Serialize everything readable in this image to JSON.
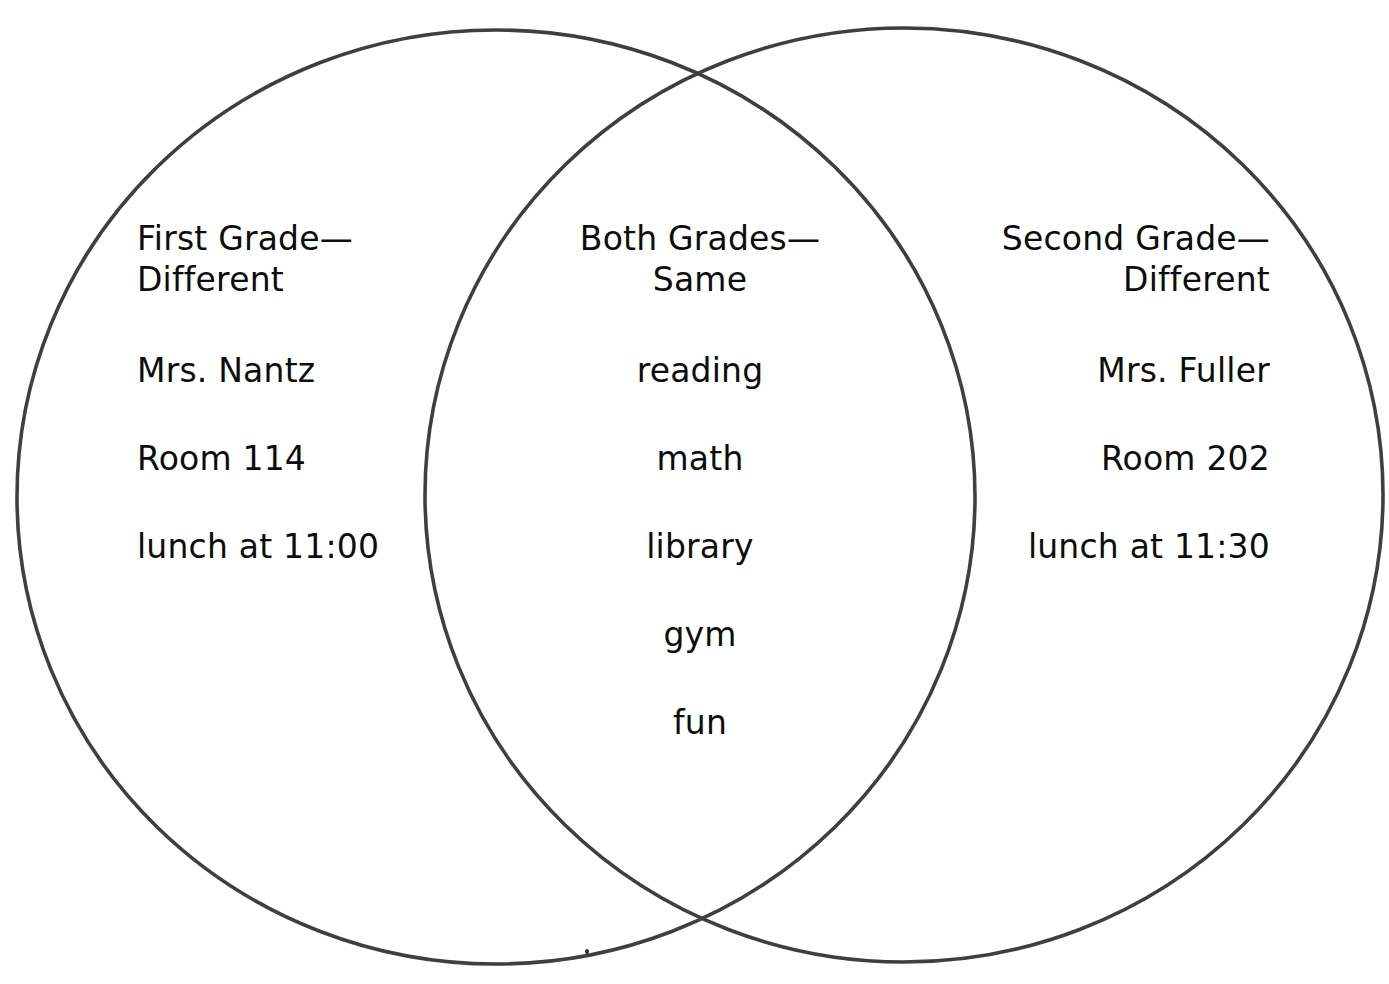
{
  "diagram": {
    "type": "venn",
    "set_count": 2,
    "background_color": "#ffffff",
    "stroke_color": "#3f3f3f",
    "text_color": "#0d0d0d",
    "left_circle": {
      "cx": 496,
      "cy": 497,
      "rx": 479,
      "ry": 467
    },
    "right_circle": {
      "cx": 904,
      "cy": 495,
      "rx": 479,
      "ry": 467
    }
  },
  "left": {
    "title": "First Grade—\nDifferent",
    "items": [
      "Mrs. Nantz",
      "Room 114",
      "lunch at 11:00"
    ]
  },
  "center": {
    "title": "Both Grades—\nSame",
    "items": [
      "reading",
      "math",
      "library",
      "gym",
      "fun"
    ]
  },
  "right": {
    "title": "Second Grade—\nDifferent",
    "items": [
      "Mrs. Fuller",
      "Room 202",
      "lunch at 11:30"
    ]
  }
}
